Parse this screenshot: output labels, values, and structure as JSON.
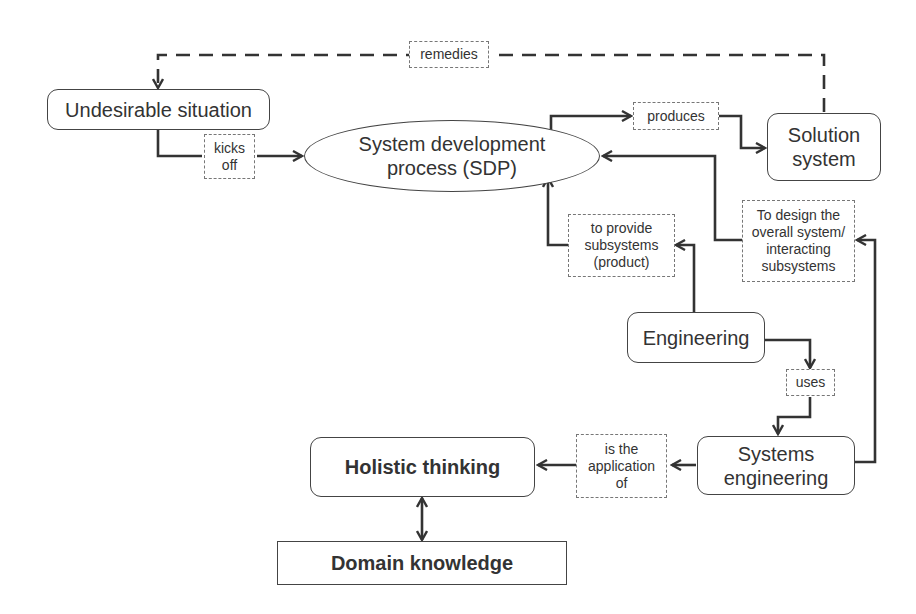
{
  "diagram": {
    "nodes": {
      "undesirable_situation": "Undesirable situation",
      "sdp": "System development\nprocess (SDP)",
      "solution_system": "Solution\nsystem",
      "engineering": "Engineering",
      "systems_engineering": "Systems\nengineering",
      "holistic_thinking": "Holistic thinking",
      "domain_knowledge": "Domain knowledge"
    },
    "labels": {
      "remedies": "remedies",
      "kicks_off": "kicks\noff",
      "produces": "produces",
      "to_provide": "to provide\nsubsystems\n(product)",
      "to_design": "To design the\noverall system/\ninteracting\nsubsystems",
      "uses": "uses",
      "is_application_of": "is the\napplication\nof"
    },
    "colors": {
      "line": "#333333",
      "label_border": "#777777",
      "background": "#ffffff"
    }
  }
}
